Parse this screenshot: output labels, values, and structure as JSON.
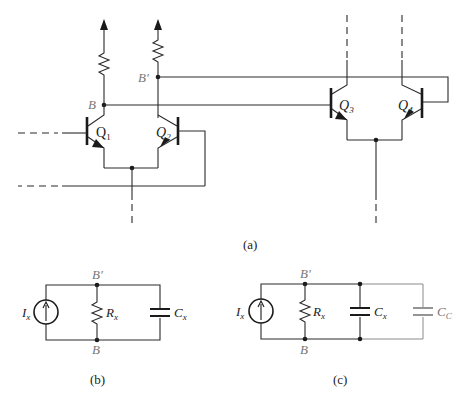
{
  "figure": {
    "panel_a": {
      "caption": "(a)",
      "nodes": {
        "B": "B",
        "B_prime": "B′"
      },
      "transistors": [
        {
          "id": "Q1",
          "label": "Q",
          "sub": "1"
        },
        {
          "id": "Q2",
          "label": "Q",
          "sub": "2"
        },
        {
          "id": "Q3",
          "label": "Q",
          "sub": "3"
        },
        {
          "id": "Q4",
          "label": "Q",
          "sub": "4"
        }
      ]
    },
    "panel_b": {
      "caption": "(b)",
      "top_node": "B′",
      "bottom_node": "B",
      "source": {
        "label": "I",
        "sub": "x"
      },
      "resistor": {
        "label": "R",
        "sub": "x"
      },
      "capacitor": {
        "label": "C",
        "sub": "x"
      }
    },
    "panel_c": {
      "caption": "(c)",
      "top_node": "B′",
      "bottom_node": "B",
      "source": {
        "label": "I",
        "sub": "x"
      },
      "resistor": {
        "label": "R",
        "sub": "x"
      },
      "capacitor": {
        "label": "C",
        "sub": "x"
      },
      "extra_capacitor": {
        "label": "C",
        "sub": "C"
      }
    }
  }
}
